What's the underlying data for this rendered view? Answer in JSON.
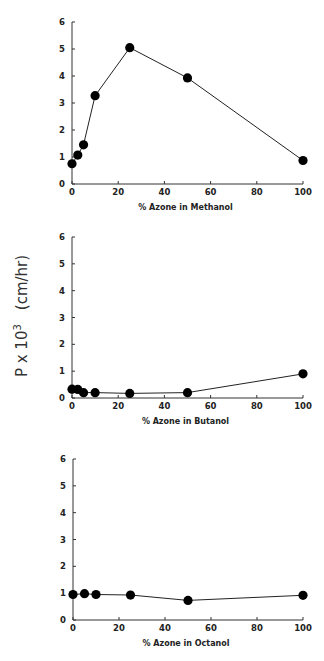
{
  "figure": {
    "shared_ylabel": "P x 103   (cm/hr)",
    "ylabel_main": "P x 10",
    "ylabel_sup": "3",
    "ylabel_units": "(cm/hr)"
  },
  "chart_data": [
    {
      "type": "line",
      "title": "",
      "xlabel": "% Azone in Methanol",
      "ylabel": "P x 10^3 (cm/hr)",
      "x": [
        0,
        2.5,
        5,
        10,
        25,
        50,
        100
      ],
      "values": [
        0.75,
        1.07,
        1.45,
        3.27,
        5.05,
        3.93,
        0.87
      ],
      "xlim": [
        0,
        100
      ],
      "ylim": [
        0,
        6
      ],
      "xticks": [
        "0",
        "20",
        "40",
        "60",
        "80",
        "100"
      ],
      "yticks": [
        "0",
        "1",
        "2",
        "3",
        "4",
        "5",
        "6"
      ],
      "grid": false,
      "marker": "filled-circle"
    },
    {
      "type": "line",
      "title": "",
      "xlabel": "% Azone in Butanol",
      "ylabel": "P x 10^3 (cm/hr)",
      "x": [
        0,
        2.5,
        5,
        10,
        25,
        50,
        100
      ],
      "values": [
        0.33,
        0.32,
        0.2,
        0.2,
        0.17,
        0.2,
        0.9
      ],
      "xlim": [
        0,
        100
      ],
      "ylim": [
        0,
        6
      ],
      "xticks": [
        "0",
        "20",
        "40",
        "60",
        "80",
        "100"
      ],
      "yticks": [
        "0",
        "1",
        "2",
        "3",
        "4",
        "5",
        "6"
      ],
      "grid": false,
      "marker": "filled-circle"
    },
    {
      "type": "line",
      "title": "",
      "xlabel": "% Azone in Octanol",
      "ylabel": "P x 10^3 (cm/hr)",
      "x": [
        0,
        5,
        10,
        25,
        50,
        100
      ],
      "values": [
        0.95,
        0.98,
        0.95,
        0.93,
        0.73,
        0.92
      ],
      "xlim": [
        0,
        100
      ],
      "ylim": [
        0,
        6
      ],
      "xticks": [
        "0",
        "20",
        "40",
        "60",
        "80",
        "100"
      ],
      "yticks": [
        "0",
        "1",
        "2",
        "3",
        "4",
        "5",
        "6"
      ],
      "grid": false,
      "marker": "filled-circle"
    }
  ]
}
